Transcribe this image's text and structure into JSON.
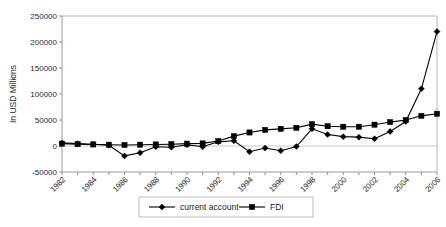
{
  "chart_data": {
    "type": "line",
    "title": "",
    "xlabel": "",
    "ylabel": "In USD Millions",
    "ylim": [
      -50000,
      250000
    ],
    "ytick_values": [
      -50000,
      0,
      50000,
      100000,
      150000,
      200000,
      250000
    ],
    "ytick_labels": [
      "-50000",
      "0",
      "50000",
      "100000",
      "150000",
      "200000",
      "250000"
    ],
    "x": [
      1982,
      1983,
      1984,
      1985,
      1986,
      1987,
      1988,
      1989,
      1990,
      1991,
      1992,
      1993,
      1994,
      1995,
      1996,
      1997,
      1998,
      1999,
      2000,
      2001,
      2002,
      2003,
      2004,
      2005,
      2006
    ],
    "xtick_labels": [
      "1982",
      "1984",
      "1986",
      "1988",
      "1990",
      "1992",
      "1994",
      "1996",
      "1998",
      "2000",
      "2002",
      "2004",
      "2006"
    ],
    "xlim": [
      1982,
      2006
    ],
    "grid": false,
    "legend_position": "bottom",
    "series": [
      {
        "name": "current account",
        "marker": "diamond",
        "color": "#000000",
        "values": [
          6000,
          4500,
          3500,
          1500,
          -19000,
          -13000,
          -1500,
          -2500,
          2500,
          -1500,
          8000,
          10000,
          -11000,
          -4000,
          -9000,
          -1000,
          33000,
          22000,
          18000,
          17000,
          14000,
          28000,
          47000,
          110000,
          220000
        ]
      },
      {
        "name": "FDI",
        "marker": "square",
        "color": "#000000",
        "values": [
          4500,
          3500,
          3000,
          2500,
          2000,
          2500,
          3000,
          3500,
          4500,
          5000,
          9500,
          19000,
          26000,
          31000,
          33000,
          35000,
          42000,
          38000,
          37000,
          37000,
          41000,
          46000,
          50000,
          58000,
          62000
        ]
      }
    ]
  },
  "legend": {
    "items": [
      {
        "label": "current account",
        "marker": "diamond"
      },
      {
        "label": "FDI",
        "marker": "square"
      }
    ]
  }
}
